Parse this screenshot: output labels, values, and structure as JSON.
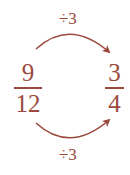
{
  "diagram": {
    "type": "equivalent-fraction-simplification",
    "top_operation": "÷3",
    "bottom_operation": "÷3",
    "source_fraction": {
      "numerator": "9",
      "denominator": "12"
    },
    "result_fraction": {
      "numerator": "3",
      "denominator": "4"
    },
    "colors": {
      "text": "#9a4a3d",
      "arrow": "#9a4a3d",
      "background": "#ffffff"
    }
  }
}
